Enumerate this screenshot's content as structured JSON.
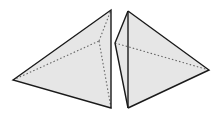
{
  "diagram": {
    "type": "geometry",
    "colors": {
      "face_fill": "#e6e6e6",
      "edge": "#1a1a1a",
      "hidden_edge": "#666666",
      "background": "#ffffff"
    },
    "shapes": [
      {
        "name": "left-pyramid",
        "vertices": {
          "left": [
            13,
            80
          ],
          "top": [
            111,
            10
          ],
          "bottom": [
            111,
            108
          ],
          "hidden": [
            99,
            41
          ]
        },
        "solid_edges": [
          [
            "left",
            "top"
          ],
          [
            "top",
            "bottom"
          ],
          [
            "bottom",
            "left"
          ]
        ],
        "hidden_edges": [
          [
            "left",
            "hidden"
          ],
          [
            "hidden",
            "top"
          ],
          [
            "hidden",
            "bottom"
          ]
        ]
      },
      {
        "name": "right-pyramid",
        "vertices": {
          "top": [
            128,
            11
          ],
          "left": [
            115,
            43
          ],
          "bottom": [
            128,
            108
          ],
          "right": [
            209,
            70
          ]
        },
        "solid_edges": [
          [
            "top",
            "left"
          ],
          [
            "left",
            "bottom"
          ],
          [
            "top",
            "bottom"
          ],
          [
            "top",
            "right"
          ],
          [
            "right",
            "bottom"
          ]
        ],
        "hidden_edges": [
          [
            "left",
            "right"
          ]
        ]
      }
    ]
  }
}
